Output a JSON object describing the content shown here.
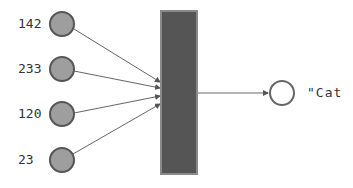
{
  "inputs": [
    {
      "value": "142",
      "cx": 62,
      "cy": 24
    },
    {
      "value": "233",
      "cx": 62,
      "cy": 69
    },
    {
      "value": "120",
      "cx": 62,
      "cy": 114
    },
    {
      "value": "23",
      "cx": 62,
      "cy": 160
    }
  ],
  "layer": {
    "x": 161,
    "y": 11,
    "width": 36,
    "height": 163,
    "fill": "#555555",
    "stroke": "#8a8a8a"
  },
  "output": {
    "label": "\"Cat",
    "cx": 282,
    "cy": 93
  },
  "colors": {
    "input_fill": "#9e9e9e",
    "node_stroke": "#555555",
    "line": "#666666",
    "output_fill": "#ffffff"
  }
}
